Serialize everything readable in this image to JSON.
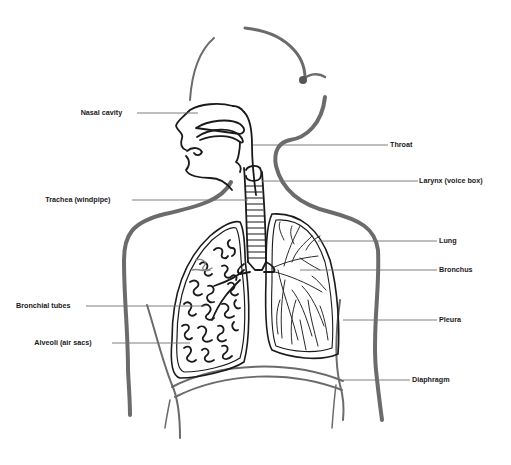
{
  "diagram": {
    "colors": {
      "ink": "#1a1a1a",
      "body_outline": "#6b6b6b",
      "leader": "#6f6f6f",
      "background": "#ffffff"
    },
    "labels_left": [
      {
        "id": "nasal-cavity",
        "text": "Nasal cavity",
        "y": 113
      },
      {
        "id": "trachea",
        "text": "Trachea (windpipe)",
        "y": 200
      },
      {
        "id": "bronchial-tubes",
        "text": "Bronchial tubes",
        "y": 306
      },
      {
        "id": "alveoli",
        "text": "Alveoli (air sacs)",
        "y": 343
      }
    ],
    "labels_right": [
      {
        "id": "throat",
        "text": "Throat",
        "y": 145
      },
      {
        "id": "larynx",
        "text": "Larynx (voice box)",
        "y": 181
      },
      {
        "id": "lung",
        "text": "Lung",
        "y": 241
      },
      {
        "id": "bronchus",
        "text": "Bronchus",
        "y": 270
      },
      {
        "id": "pleura",
        "text": "Pleura",
        "y": 320
      },
      {
        "id": "diaphragm",
        "text": "Diaphragm",
        "y": 380
      }
    ]
  }
}
